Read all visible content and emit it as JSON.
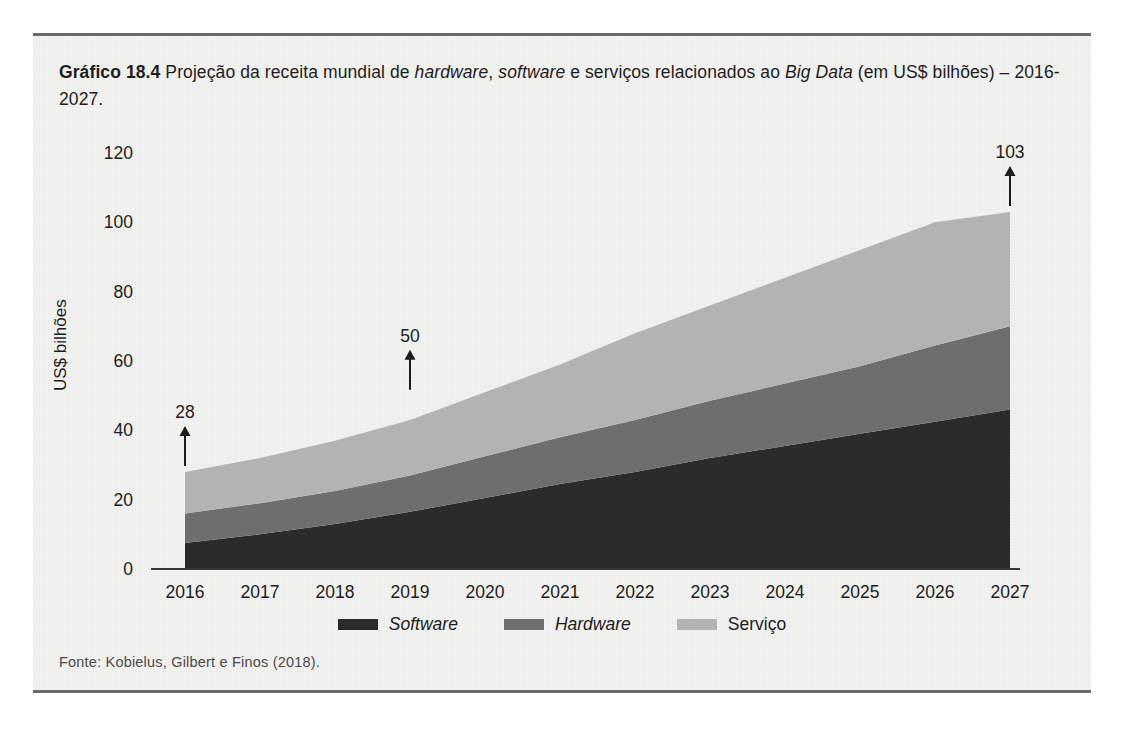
{
  "figure": {
    "caption_prefix": "Gráfico 18.4",
    "caption_rest_1": " Projeção da receita mundial de ",
    "caption_em_1": "hardware",
    "caption_rest_2": ", ",
    "caption_em_2": "software",
    "caption_rest_3": " e serviços relacionados ao ",
    "caption_em_3": "Big Data",
    "caption_rest_4": " (em US$ bilhões) – 2016-2027.",
    "source": "Fonte: Kobielus, Gilbert e Finos (2018)."
  },
  "colors": {
    "software": "#2b2b2b",
    "hardware": "#6e6e6e",
    "servico": "#b3b3b3",
    "panel_bg": "#f2f2f0",
    "axis": "#3a3a3a",
    "text": "#1d1d1d"
  },
  "chart_data": {
    "type": "area",
    "stacked": true,
    "title": "Projeção da receita mundial de hardware, software e serviços relacionados ao Big Data (em US$ bilhões) – 2016-2027",
    "xlabel": "",
    "ylabel": "US$ bilhões",
    "categories": [
      "2016",
      "2017",
      "2018",
      "2019",
      "2020",
      "2021",
      "2022",
      "2023",
      "2024",
      "2025",
      "2026",
      "2027"
    ],
    "x": [
      2016,
      2017,
      2018,
      2019,
      2020,
      2021,
      2022,
      2023,
      2024,
      2025,
      2026,
      2027
    ],
    "ylim": [
      0,
      120
    ],
    "yticks": [
      0,
      20,
      40,
      60,
      80,
      100,
      120
    ],
    "grid": false,
    "legend_position": "bottom",
    "series": [
      {
        "name": "Software",
        "color": "#2b2b2b",
        "values": [
          7.5,
          10,
          13,
          16.5,
          20.5,
          24.5,
          28,
          32,
          35.5,
          39,
          42.5,
          46
        ]
      },
      {
        "name": "Hardware",
        "color": "#6e6e6e",
        "values": [
          8.5,
          9,
          9.5,
          10.5,
          12,
          13.5,
          15,
          16.5,
          18,
          19.5,
          22,
          24
        ]
      },
      {
        "name": "Serviço",
        "color": "#b3b3b3",
        "values": [
          12,
          13,
          14.5,
          16,
          18.5,
          21,
          25,
          27.5,
          30.5,
          33.5,
          35.5,
          33
        ]
      }
    ],
    "totals": [
      28,
      32,
      37,
      43,
      51,
      59,
      68,
      76,
      84,
      92,
      100,
      103
    ],
    "annotations": [
      {
        "label": "28",
        "x": 2016,
        "value": 28
      },
      {
        "label": "50",
        "x": 2019,
        "value": 50
      },
      {
        "label": "103",
        "x": 2027,
        "value": 103
      }
    ]
  },
  "legend": {
    "items": [
      {
        "label": "Software",
        "italic": true
      },
      {
        "label": "Hardware",
        "italic": true
      },
      {
        "label": "Serviço",
        "italic": false
      }
    ]
  }
}
